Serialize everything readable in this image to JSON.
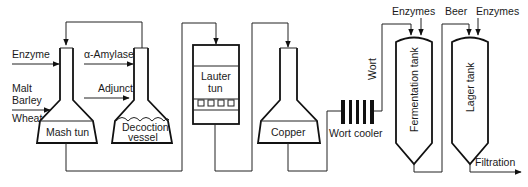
{
  "inputs": {
    "enzyme": "Enzyme",
    "malt": "Malt",
    "barley": "Barley",
    "wheat": "Wheat",
    "alpha_amylase": "α-Amylase",
    "adjunct": "Adjunct",
    "enzymes_fermentation": "Enzymes",
    "enzymes_lager": "Enzymes"
  },
  "vessels": {
    "mash_tun": "Mash tun",
    "decoction_vessel_line1": "Decoction",
    "decoction_vessel_line2": "vessel",
    "lauter_tun_line1": "Lauter",
    "lauter_tun_line2": "tun",
    "copper": "Copper",
    "wort_cooler": "Wort cooler",
    "fermentation_tank": "Fermentation tank",
    "lager_tank": "Lager tank"
  },
  "flows": {
    "wort": "Wort",
    "beer": "Beer",
    "filtration": "Filtration"
  }
}
